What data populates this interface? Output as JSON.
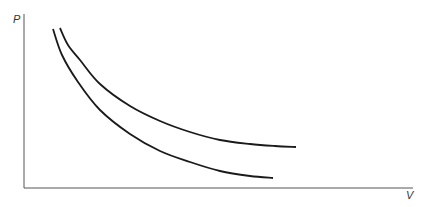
{
  "diagram": {
    "type": "pv-diagram",
    "axes": {
      "y_label": "P",
      "x_label": "V"
    },
    "curves": [
      {
        "name": "upper-curve",
        "points": [
          [
            60,
            28
          ],
          [
            68,
            45
          ],
          [
            80,
            60
          ],
          [
            100,
            84
          ],
          [
            130,
            106
          ],
          [
            160,
            121
          ],
          [
            190,
            132
          ],
          [
            220,
            140
          ],
          [
            250,
            144
          ],
          [
            275,
            146
          ],
          [
            296,
            147
          ]
        ]
      },
      {
        "name": "lower-curve",
        "points": [
          [
            53,
            29
          ],
          [
            62,
            55
          ],
          [
            78,
            82
          ],
          [
            100,
            110
          ],
          [
            130,
            134
          ],
          [
            160,
            151
          ],
          [
            190,
            162
          ],
          [
            220,
            171
          ],
          [
            250,
            176
          ],
          [
            273,
            178
          ]
        ]
      }
    ],
    "colors": {
      "line": "#1a1a1a",
      "axis": "#444444"
    }
  }
}
